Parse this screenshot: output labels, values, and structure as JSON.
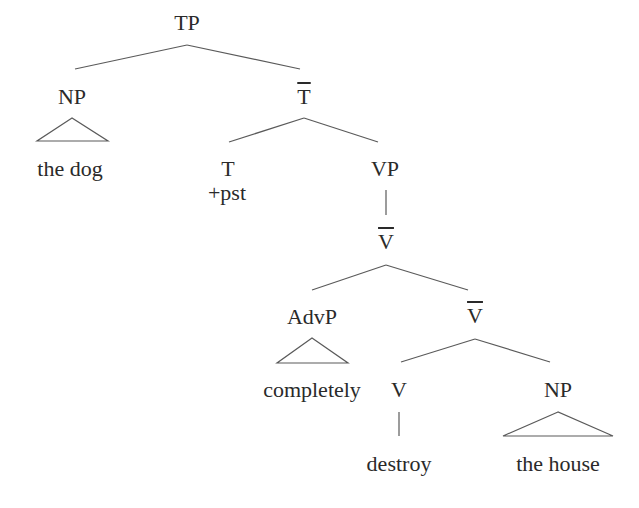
{
  "diagram": {
    "type": "syntax-tree",
    "nodes": {
      "tp": {
        "label": "TP"
      },
      "np_subject": {
        "label": "NP",
        "yield": "the dog"
      },
      "t_bar": {
        "label": "T",
        "bar": true
      },
      "t": {
        "label": "T",
        "feature": "+pst"
      },
      "vp": {
        "label": "VP"
      },
      "v_bar_upper": {
        "label": "V",
        "bar": true
      },
      "advp": {
        "label": "AdvP",
        "yield": "completely"
      },
      "v_bar_lower": {
        "label": "V",
        "bar": true
      },
      "v": {
        "label": "V",
        "yield": "destroy"
      },
      "np_object": {
        "label": "NP",
        "yield": "the house"
      }
    },
    "edges": [
      [
        "TP",
        "NP"
      ],
      [
        "TP",
        "T-bar"
      ],
      [
        "T-bar",
        "T"
      ],
      [
        "T-bar",
        "VP"
      ],
      [
        "VP",
        "V-bar"
      ],
      [
        "V-bar",
        "AdvP"
      ],
      [
        "V-bar",
        "V-bar"
      ],
      [
        "V-bar",
        "V"
      ],
      [
        "V-bar",
        "NP"
      ],
      [
        "V",
        "destroy"
      ]
    ],
    "colors": {
      "background": "#ffffff",
      "text": "#2a2a2a",
      "lines": "#5a5a5a"
    }
  }
}
